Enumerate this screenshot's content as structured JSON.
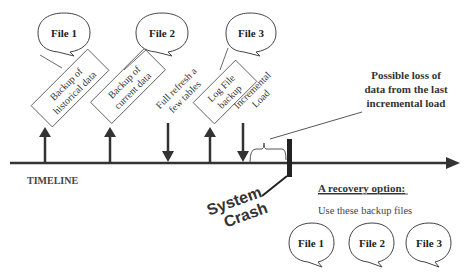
{
  "timeline": {
    "label": "TIMELINE",
    "color": "#333333"
  },
  "events": [
    {
      "id": "backup-historical",
      "direction": "up",
      "lines": [
        "Backup of",
        "historical data"
      ],
      "file": "File 1"
    },
    {
      "id": "backup-current",
      "direction": "up",
      "lines": [
        "Backup of",
        "current data"
      ],
      "file": "File 2"
    },
    {
      "id": "full-refresh",
      "direction": "down",
      "lines": [
        "Full refresh a",
        "few tables"
      ]
    },
    {
      "id": "log-file-backup",
      "direction": "up",
      "lines": [
        "Log File",
        "backup"
      ],
      "file": "File 3"
    },
    {
      "id": "incremental-load",
      "direction": "down",
      "lines": [
        "Incremental",
        "Load"
      ]
    }
  ],
  "crash": {
    "lines": [
      "System",
      "Crash"
    ]
  },
  "loss_note": {
    "lines": [
      "Possible loss of",
      "data from the last",
      "incremental load"
    ]
  },
  "recovery": {
    "title": "A recovery option",
    "title_suffix": ":",
    "subtitle": "Use these backup files",
    "files": [
      "File 1",
      "File 2",
      "File 3"
    ]
  }
}
